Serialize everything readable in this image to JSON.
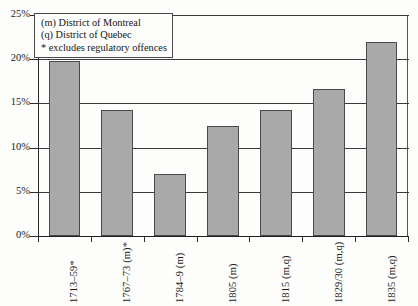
{
  "chart_data": {
    "type": "bar",
    "title": "",
    "xlabel": "",
    "ylabel": "",
    "ylim": [
      0,
      25
    ],
    "grid": true,
    "legend_position": "top-left",
    "categories": [
      "1713–59*",
      "1767–73 (m)*",
      "1784–9 (m)",
      "1805 (m)",
      "1815 (m,q)",
      "1829/30 (m,q)",
      "1835 (m,q)"
    ],
    "values": [
      19.8,
      14.3,
      7.0,
      12.4,
      14.2,
      16.6,
      22.0
    ],
    "ytick_labels": [
      "0%",
      "5%",
      "10%",
      "15%",
      "20%",
      "25%"
    ],
    "ytick_values": [
      0,
      5,
      10,
      15,
      20,
      25
    ],
    "annotations": [
      "(m) District of Montreal",
      "(q) District of Quebec",
      "* excludes regulatory offences"
    ],
    "bar_color": "#a9a9a9",
    "bar_border_color": "#4a4a4a",
    "axis_color": "#2b2b2b"
  }
}
